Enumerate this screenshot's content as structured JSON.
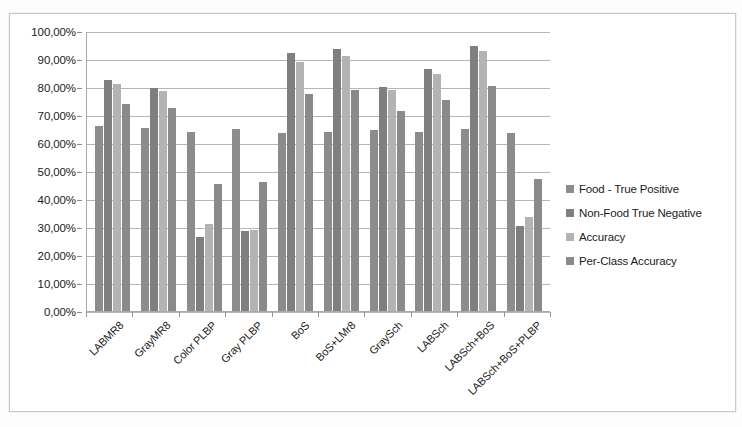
{
  "chart_data": {
    "type": "bar",
    "title": "",
    "xlabel": "",
    "ylabel": "",
    "ylim": [
      0,
      100
    ],
    "grid": true,
    "legend_position": "right",
    "y_tick_labels": [
      "100,00%",
      "90,00%",
      "80,00%",
      "70,00%",
      "60,00%",
      "50,00%",
      "40,00%",
      "30,00%",
      "20,00%",
      "10,00%",
      "0,00%"
    ],
    "y_tick_values": [
      100,
      90,
      80,
      70,
      60,
      50,
      40,
      30,
      20,
      10,
      0
    ],
    "categories": [
      "LABMR8",
      "GrayMR8",
      "Color PLBP",
      "Gray PLBP",
      "BoS",
      "BoS+LMr8",
      "GraySch",
      "LABSch",
      "LABSch+BoS",
      "LABSch+BoS+PLBP"
    ],
    "series": [
      {
        "name": "Food - True Positive",
        "color": "#8c8c8c",
        "values": [
          66.0,
          65.5,
          64.0,
          65.0,
          63.5,
          64.0,
          64.5,
          64.0,
          65.0,
          63.5
        ]
      },
      {
        "name": "Non-Food True Negative",
        "color": "#7f7f7f",
        "values": [
          82.5,
          79.5,
          26.5,
          28.5,
          92.0,
          93.5,
          80.0,
          86.5,
          94.5,
          30.5
        ]
      },
      {
        "name": "Accuracy",
        "color": "#b3b3b3",
        "values": [
          81.0,
          78.5,
          31.0,
          29.0,
          89.0,
          91.0,
          79.0,
          84.5,
          93.0,
          33.5
        ]
      },
      {
        "name": "Per-Class Accuracy",
        "color": "#8a8a8a",
        "values": [
          74.0,
          72.5,
          45.5,
          46.0,
          77.5,
          79.0,
          71.5,
          75.5,
          80.5,
          47.0
        ]
      }
    ]
  }
}
